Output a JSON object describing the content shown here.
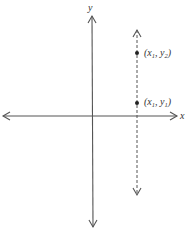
{
  "diagram": {
    "type": "coordinate-plane-vertical-line",
    "axes": {
      "x_label": "x",
      "y_label": "y",
      "color": "#555555"
    },
    "vertical_line": {
      "style": "dashed",
      "color": "#555555"
    },
    "points": [
      {
        "label_prefix": "(x",
        "sub1": "1",
        "mid": ", y",
        "sub2": "2",
        "suffix": ")"
      },
      {
        "label_prefix": "(x",
        "sub1": "1",
        "mid": ", y",
        "sub2": "1",
        "suffix": ")"
      }
    ]
  }
}
